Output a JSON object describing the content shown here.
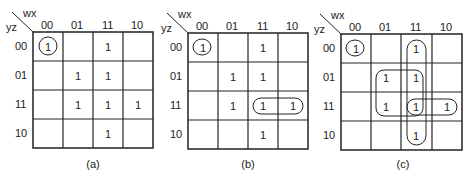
{
  "axis": {
    "column_var": "wx",
    "row_var": "yz"
  },
  "column_labels": [
    "00",
    "01",
    "11",
    "10"
  ],
  "row_labels": [
    "00",
    "01",
    "11",
    "10"
  ],
  "maps": [
    {
      "caption": "(a)",
      "cells": [
        [
          "1",
          "",
          "1",
          ""
        ],
        [
          "",
          "1",
          "1",
          ""
        ],
        [
          "",
          "1",
          "1",
          "1"
        ],
        [
          "",
          "",
          "1",
          ""
        ]
      ],
      "groupings": [
        {
          "type": "circle",
          "cells": [
            [
              0,
              0
            ]
          ]
        }
      ]
    },
    {
      "caption": "(b)",
      "cells": [
        [
          "1",
          "",
          "1",
          ""
        ],
        [
          "",
          "1",
          "1",
          ""
        ],
        [
          "",
          "1",
          "1",
          "1"
        ],
        [
          "",
          "",
          "1",
          ""
        ]
      ],
      "groupings": [
        {
          "type": "circle",
          "cells": [
            [
              0,
              0
            ]
          ]
        },
        {
          "type": "loop",
          "cells": [
            [
              2,
              2
            ],
            [
              2,
              3
            ]
          ]
        }
      ]
    },
    {
      "caption": "(c)",
      "cells": [
        [
          "1",
          "",
          "1",
          ""
        ],
        [
          "",
          "1",
          "1",
          ""
        ],
        [
          "",
          "1",
          "1",
          "1"
        ],
        [
          "",
          "",
          "1",
          ""
        ]
      ],
      "groupings": [
        {
          "type": "circle",
          "cells": [
            [
              0,
              0
            ]
          ]
        },
        {
          "type": "loop",
          "cells": [
            [
              2,
              2
            ],
            [
              2,
              3
            ]
          ]
        },
        {
          "type": "loop",
          "cells": [
            [
              0,
              2
            ],
            [
              1,
              2
            ],
            [
              2,
              2
            ],
            [
              3,
              2
            ]
          ]
        },
        {
          "type": "loop",
          "cells": [
            [
              1,
              1
            ],
            [
              1,
              2
            ],
            [
              2,
              1
            ],
            [
              2,
              2
            ]
          ]
        }
      ]
    }
  ]
}
